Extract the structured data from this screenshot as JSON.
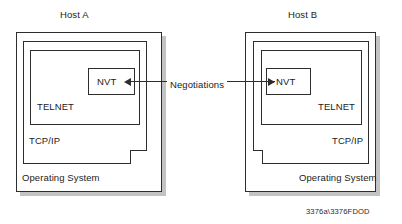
{
  "figure": {
    "caption": "3376a\\3376FDOD",
    "connection_label": "Negotiations",
    "hosts": [
      {
        "id": "host-a",
        "title": "Host A",
        "side": "left",
        "layers": [
          {
            "name": "operating-system",
            "label": "Operating System"
          },
          {
            "name": "tcp-ip",
            "label": "TCP/IP"
          },
          {
            "name": "telnet",
            "label": "TELNET"
          },
          {
            "name": "nvt",
            "label": "NVT"
          }
        ]
      },
      {
        "id": "host-b",
        "title": "Host B",
        "side": "right",
        "layers": [
          {
            "name": "operating-system",
            "label": "Operating System"
          },
          {
            "name": "tcp-ip",
            "label": "TCP/IP"
          },
          {
            "name": "telnet",
            "label": "TELNET"
          },
          {
            "name": "nvt",
            "label": "NVT"
          }
        ]
      }
    ],
    "colors": {
      "stroke": "#2d2d2d",
      "fill": "#ffffff",
      "shadow": "#b9b9b9",
      "text": "#222222",
      "background": "#ffffff"
    }
  }
}
